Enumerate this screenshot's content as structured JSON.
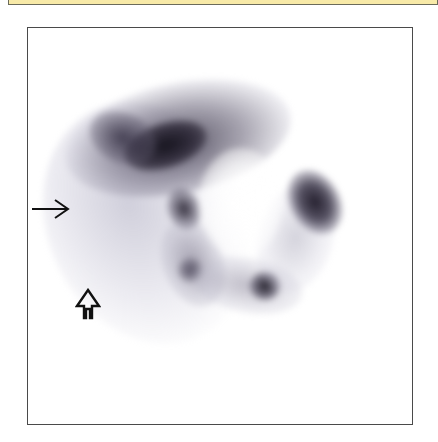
{
  "figure": {
    "type": "scintigraphy-scan",
    "colors": {
      "header_strip": "#f8eaa8",
      "frame_border": "#4a4a4a",
      "uptake_dark": "#1a1420",
      "uptake_mid": "#7a7488",
      "uptake_faint": "#d4d2e0",
      "background": "#ffffff"
    },
    "annotations": [
      {
        "name": "solid-arrow",
        "direction": "right",
        "style": "line-arrow"
      },
      {
        "name": "hollow-arrow",
        "direction": "up",
        "style": "outline-arrow"
      }
    ]
  }
}
